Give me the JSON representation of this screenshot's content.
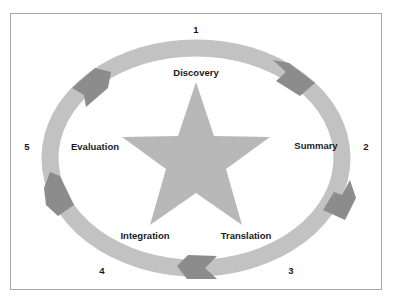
{
  "diagram": {
    "type": "cycle",
    "center_shape": "star",
    "colors": {
      "ring": "#c2c2c2",
      "arrow": "#8c8c8c",
      "star": "#b8b8b8",
      "frame": "#a8a8a8",
      "text": "#1a1a1a"
    },
    "stages": [
      {
        "number": "1",
        "label": "Discovery"
      },
      {
        "number": "2",
        "label": "Summary"
      },
      {
        "number": "3",
        "label": "Translation"
      },
      {
        "number": "4",
        "label": "Integration"
      },
      {
        "number": "5",
        "label": "Evaluation"
      }
    ]
  }
}
